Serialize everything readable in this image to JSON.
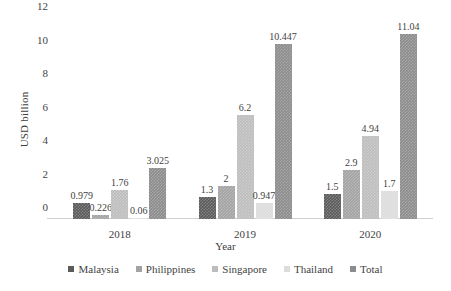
{
  "chart_data": {
    "type": "bar",
    "title": "",
    "subtitle": "",
    "xlabel": "Year",
    "ylabel": "USD billion",
    "categories": [
      "2018",
      "2019",
      "2020"
    ],
    "ylim": [
      0,
      12
    ],
    "yticks": [
      0,
      2,
      4,
      6,
      8,
      10,
      12
    ],
    "ytick_labels": [
      "0",
      "2",
      "4",
      "6",
      "8",
      "10",
      "12"
    ],
    "grid": false,
    "legend_position": "bottom",
    "value_labels": true,
    "series": [
      {
        "name": "Malaysia",
        "color": "#5b5b5b",
        "values": [
          0.979,
          1.3,
          1.5
        ],
        "labels": [
          "0.979",
          "1.3",
          "1.5"
        ]
      },
      {
        "name": "Philippines",
        "color": "#a3a3a3",
        "values": [
          0.226,
          2,
          2.9
        ],
        "labels": [
          "0.226",
          "2",
          "2.9"
        ]
      },
      {
        "name": "Singapore",
        "color": "#bdbdbd",
        "values": [
          1.76,
          6.2,
          4.94
        ],
        "labels": [
          "1.76",
          "6.2",
          "4.94"
        ]
      },
      {
        "name": "Thailand",
        "color": "#dcdcdc",
        "values": [
          0.06,
          0.947,
          1.7
        ],
        "labels": [
          "0.06",
          "0.947",
          "1.7"
        ]
      },
      {
        "name": "Total",
        "color": "#8c8c8c",
        "values": [
          3.025,
          10.447,
          11.04
        ],
        "labels": [
          "3.025",
          "10.447",
          "11.04"
        ]
      }
    ]
  }
}
